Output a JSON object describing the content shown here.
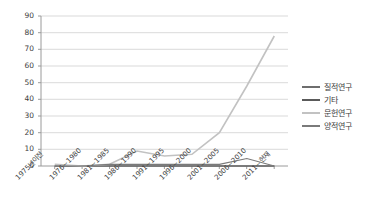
{
  "chart_data": {
    "type": "line",
    "title": "",
    "xlabel": "",
    "ylabel": "",
    "ylim": [
      0,
      90
    ],
    "yticks": [
      0,
      10,
      20,
      30,
      40,
      50,
      60,
      70,
      80,
      90
    ],
    "grid": true,
    "legend_position": "right",
    "categories": [
      "1975년이전",
      "1976~1980",
      "1981~1985",
      "1986~1990",
      "1991~1995",
      "1996~2000",
      "2001~2005",
      "2006~2010",
      "2011~현재"
    ],
    "series": [
      {
        "name": "질적연구",
        "color": "#6e6e6e",
        "values": [
          0,
          0,
          0,
          0,
          0,
          0,
          0,
          0,
          0
        ]
      },
      {
        "name": "기타",
        "color": "#5a5a5a",
        "values": [
          0,
          0,
          0,
          0,
          0,
          0,
          0,
          0,
          0
        ]
      },
      {
        "name": "문헌연구",
        "color": "#c2c2c2",
        "values": [
          1,
          0,
          1,
          9,
          6,
          7,
          20,
          48,
          78
        ]
      },
      {
        "name": "양적연구",
        "color": "#7a7a7a",
        "values": [
          0,
          0,
          1,
          1,
          1,
          1,
          1,
          4.5,
          0
        ]
      }
    ]
  },
  "axes": {
    "y_labels": [
      "90",
      "80",
      "70",
      "60",
      "50",
      "40",
      "30",
      "20",
      "10",
      "0"
    ],
    "x_labels": [
      "1975년이전",
      "1976~1980",
      "1981~1985",
      "1986~1990",
      "1991~1995",
      "1996~2000",
      "2001~2005",
      "2006~2010",
      "2011~현재"
    ]
  },
  "legend": {
    "items": [
      {
        "label": "질적연구"
      },
      {
        "label": "기타"
      },
      {
        "label": "문헌연구"
      },
      {
        "label": "양적연구"
      }
    ]
  },
  "colors": {
    "grid": "#cfcfcf",
    "axis": "#8a8a8a",
    "text": "#3d3d3d",
    "series_light": "#c2c2c2",
    "series_dark": "#6e6e6e"
  }
}
